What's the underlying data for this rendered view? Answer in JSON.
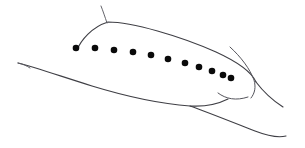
{
  "figure": {
    "background_color": "#ffffff",
    "stroke_color": "#3f3f45",
    "dot_color": "#0a0a0a",
    "width": 305,
    "height": 148,
    "caption": ""
  },
  "chart_data": {
    "type": "scatter",
    "title": "",
    "xlabel": "",
    "ylabel": "",
    "xlim": [
      0,
      305
    ],
    "ylim": [
      148,
      0
    ],
    "grid": false,
    "legend_position": "none",
    "series": [
      {
        "name": "dot-row",
        "marker": "filled-circle",
        "marker_radius": 3.3,
        "color": "#0a0a0a",
        "count": 11,
        "x": [
          76,
          95,
          114,
          133,
          151,
          168,
          185,
          199,
          212,
          223,
          231
        ],
        "y": [
          48,
          48,
          50,
          52,
          55,
          59,
          63,
          67,
          71,
          75,
          78
        ]
      }
    ],
    "annotations": []
  },
  "strokes": {
    "dorsal_contour": "M 77 50 C 81 40 92 27 108 22 C 132 22 180 36 216 52 C 240 63 252 73 256 82",
    "apex_tick": "M 107 23 C 105 17 103 11 101 6",
    "right_tip_upper": "M 256 82 C 262 90 272 100 283 107",
    "right_inner_curve": "M 230 47 C 241 57 250 69 254 80 C 256 87 255 93 251 98",
    "ventral_contour": "M 18 63 C 34 67 60 76 92 86 C 128 97 163 104 190 106 C 206 107 218 104 228 99",
    "ventral_lower_branch": "M 190 106 C 207 112 232 122 255 131 C 268 136 278 138 286 136",
    "mouth_curve": "M 218 93 C 226 99 236 101 248 97",
    "ventral_left_tail": "M 18 63 C 23 64 27 66 30 68"
  }
}
